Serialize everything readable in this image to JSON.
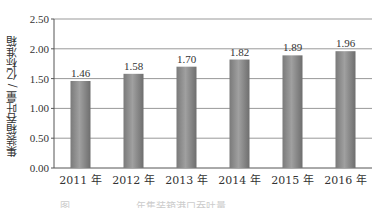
{
  "chart_data": {
    "type": "bar",
    "title": "",
    "categories": [
      "2011 年",
      "2012 年",
      "2013 年",
      "2014 年",
      "2015 年",
      "2016 年"
    ],
    "values": [
      1.46,
      1.58,
      1.7,
      1.82,
      1.89,
      1.96
    ],
    "data_labels": [
      "1.46",
      "1.58",
      "1.70",
      "1.82",
      "1.89",
      "1.96"
    ],
    "xlabel": "",
    "ylabel": "集装箱吞吐量 / 亿标准箱",
    "ylim": [
      0,
      2.5
    ],
    "yticks": [
      "0.00",
      "0.50",
      "1.00",
      "1.50",
      "2.00",
      "2.50"
    ],
    "grid": true,
    "legend": "none",
    "bar_color": "#8a8a8a"
  },
  "caption": "图 ……………… 年集装箱港口吞吐量……"
}
